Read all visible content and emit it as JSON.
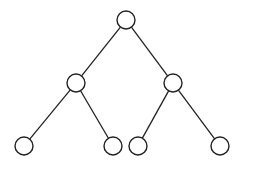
{
  "diagram": {
    "type": "binary-tree",
    "width": 274,
    "height": 172,
    "node_radius": 9,
    "colors": {
      "stroke": "#222222",
      "fill": "#ffffff",
      "background": "#ffffff"
    },
    "nodes": [
      {
        "id": "root",
        "x": 126,
        "y": 20,
        "label": ""
      },
      {
        "id": "left",
        "x": 76,
        "y": 83,
        "label": ""
      },
      {
        "id": "right",
        "x": 173,
        "y": 83,
        "label": ""
      },
      {
        "id": "left-left",
        "x": 24,
        "y": 146,
        "label": ""
      },
      {
        "id": "left-right",
        "x": 113,
        "y": 146,
        "label": ""
      },
      {
        "id": "right-left",
        "x": 138,
        "y": 146,
        "label": ""
      },
      {
        "id": "right-right",
        "x": 220,
        "y": 146,
        "label": ""
      }
    ],
    "edges": [
      {
        "from": "root",
        "to": "left"
      },
      {
        "from": "root",
        "to": "right"
      },
      {
        "from": "left",
        "to": "left-left"
      },
      {
        "from": "left",
        "to": "left-right"
      },
      {
        "from": "right",
        "to": "right-left"
      },
      {
        "from": "right",
        "to": "right-right"
      }
    ]
  }
}
